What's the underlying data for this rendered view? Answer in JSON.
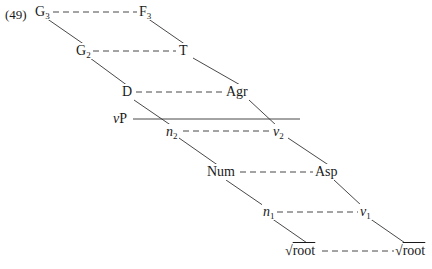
{
  "example_number": "(49)",
  "nodes": {
    "G3": {
      "base": "G",
      "sub": "3"
    },
    "F3": {
      "base": "F",
      "sub": "3"
    },
    "G2": {
      "base": "G",
      "sub": "2"
    },
    "T": {
      "base": "T",
      "sub": ""
    },
    "D": {
      "base": "D",
      "sub": ""
    },
    "Agr": {
      "base": "Agr",
      "sub": ""
    },
    "vP": {
      "italic": "v",
      "rest": "P"
    },
    "n2": {
      "base": "n",
      "sub": "2"
    },
    "v2": {
      "base": "v",
      "sub": "2"
    },
    "Num": {
      "base": "Num",
      "sub": ""
    },
    "Asp": {
      "base": "Asp",
      "sub": ""
    },
    "n1": {
      "base": "n",
      "sub": "1"
    },
    "v1": {
      "base": "v",
      "sub": "1"
    },
    "root_left": {
      "radical": "√",
      "text": "root"
    },
    "root_right": {
      "radical": "√",
      "text": "root"
    }
  },
  "colors": {
    "ink": "#1a1a1a",
    "background": "#ffffff"
  }
}
